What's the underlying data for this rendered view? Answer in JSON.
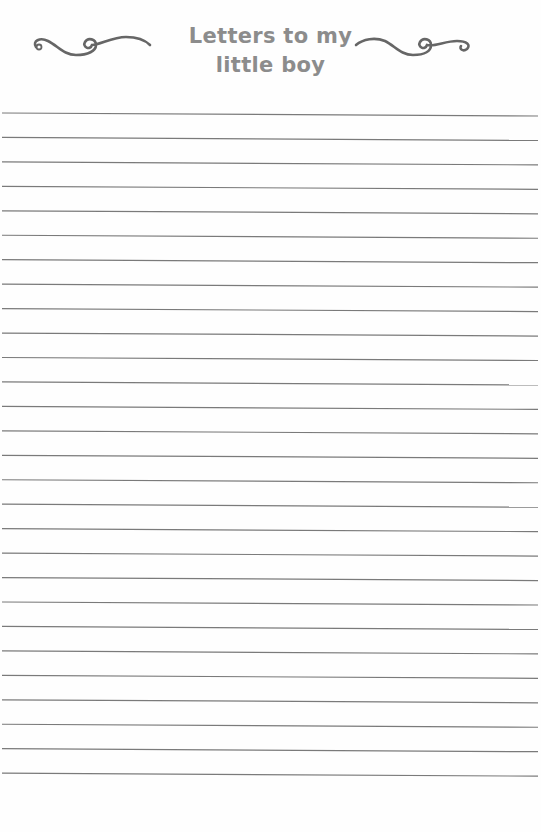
{
  "header": {
    "title_line_1": "Letters to my",
    "title_line_2": "little boy",
    "left_ornament": "flourish-icon",
    "right_ornament": "flourish-icon"
  },
  "colors": {
    "title": "#8c8c8c",
    "ornament": "#666666",
    "rule_line": "#7a7a7a",
    "paper": "#fefefe"
  },
  "ruled_lines": {
    "count": 28,
    "first_y": 113,
    "spacing": 24.45,
    "x_start": 2,
    "x_end": 538
  }
}
